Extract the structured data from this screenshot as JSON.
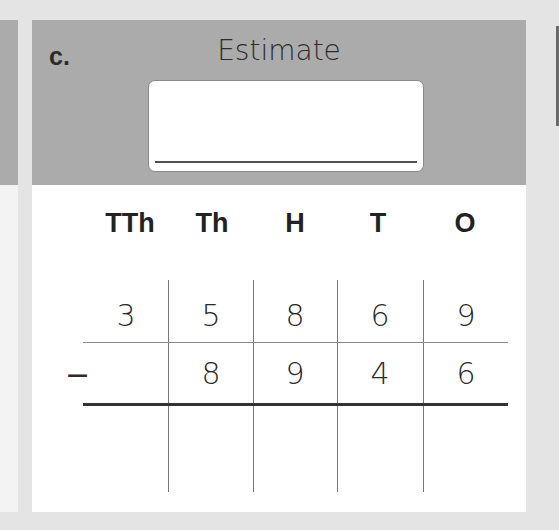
{
  "problem": {
    "label": "c.",
    "estimate_title": "Estimate",
    "estimate_value": ""
  },
  "place_value_headers": [
    "TTh",
    "Th",
    "H",
    "T",
    "O"
  ],
  "rows": {
    "minuend": [
      "3",
      "5",
      "8",
      "6",
      "9"
    ],
    "operator": "−",
    "subtrahend": [
      "",
      "8",
      "9",
      "4",
      "6"
    ],
    "answer": [
      "",
      "",
      "",
      "",
      ""
    ]
  },
  "colors": {
    "header_band": "#ababab",
    "background": "#e4e4e4",
    "card": "#ffffff",
    "text": "#2a2a2a"
  }
}
